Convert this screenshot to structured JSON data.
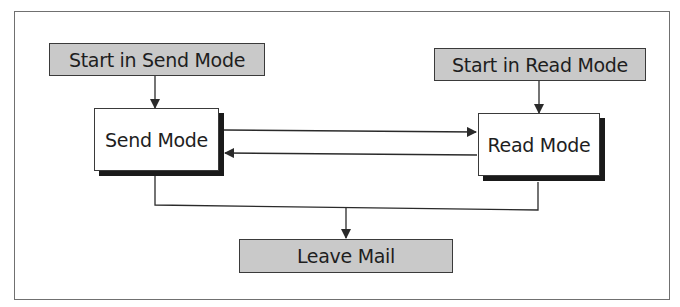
{
  "diagram": {
    "type": "state-flow",
    "nodes": {
      "start_send": {
        "label": "Start in Send Mode",
        "style": "gray"
      },
      "start_read": {
        "label": "Start in Read Mode",
        "style": "gray"
      },
      "send_mode": {
        "label": "Send Mode",
        "style": "white-shadow"
      },
      "read_mode": {
        "label": "Read Mode",
        "style": "white-shadow"
      },
      "leave_mail": {
        "label": "Leave Mail",
        "style": "gray"
      }
    },
    "edges": [
      {
        "from": "start_send",
        "to": "send_mode"
      },
      {
        "from": "start_read",
        "to": "read_mode"
      },
      {
        "from": "send_mode",
        "to": "read_mode"
      },
      {
        "from": "read_mode",
        "to": "send_mode"
      },
      {
        "from": "send_mode",
        "to": "leave_mail"
      },
      {
        "from": "read_mode",
        "to": "leave_mail"
      }
    ],
    "colors": {
      "gray_fill": "#c9c9c9",
      "line": "#2a2a2a",
      "shadow": "#1a1a1a",
      "frame": "#707070"
    }
  }
}
